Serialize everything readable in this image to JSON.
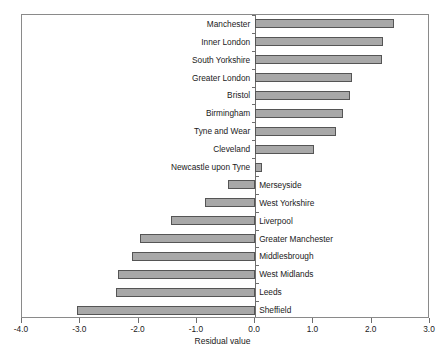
{
  "chart_data": {
    "type": "bar",
    "orientation": "horizontal",
    "title": "",
    "subtitle": "",
    "xlabel": "Residual value",
    "ylabel": "",
    "xlim": [
      -4.0,
      3.0
    ],
    "xticks": [
      -4.0,
      -3.0,
      -2.0,
      -1.0,
      0.0,
      1.0,
      2.0,
      3.0
    ],
    "xticklabels": [
      "-4.0",
      "-3.0",
      "-2.0",
      "-1.0",
      "0.0",
      "1.0",
      "2.0",
      "3.0"
    ],
    "grid": false,
    "legend": false,
    "bar_fill_color": "#a8a8a8",
    "bar_edge_color": "#555555",
    "axis_color": "#6e6e6e",
    "categories": [
      "Manchester",
      "Inner London",
      "South Yorkshire",
      "Greater London",
      "Bristol",
      "Birmingham",
      "Tyne and Wear",
      "Cleveland",
      "Newcastle upon Tyne",
      "Merseyside",
      "West Yorkshire",
      "Liverpool",
      "Greater Manchester",
      "Middlesbrough",
      "West Midlands",
      "Leeds",
      "Sheffield"
    ],
    "values": [
      2.39,
      2.2,
      2.18,
      1.66,
      1.63,
      1.5,
      1.39,
      1.01,
      0.12,
      -0.47,
      -0.86,
      -1.45,
      -1.98,
      -2.12,
      -2.35,
      -2.39,
      -3.06
    ]
  }
}
